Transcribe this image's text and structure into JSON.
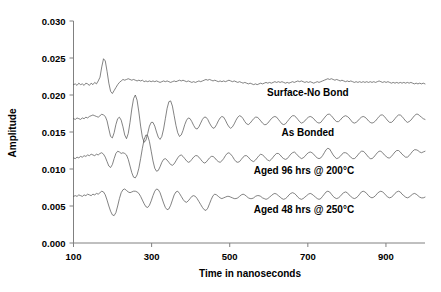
{
  "chart_data": {
    "type": "line",
    "title": "",
    "xlabel": "Time in nanoseconds",
    "ylabel": "Amplitude",
    "xlim": [
      100,
      1000
    ],
    "ylim": [
      0.0,
      0.03
    ],
    "xticks": [
      100,
      300,
      500,
      700,
      900
    ],
    "xtick_labels": [
      "100",
      "300",
      "500",
      "700",
      "900"
    ],
    "yticks": [
      0.0,
      0.005,
      0.01,
      0.015,
      0.02,
      0.025,
      0.03
    ],
    "ytick_labels": [
      "0.000",
      "0.005",
      "0.010",
      "0.015",
      "0.020",
      "0.025",
      "0.030"
    ],
    "grid": false,
    "legend_position": "inline-right-of-trace",
    "line_color": "#4d4d4d",
    "background_color": "#ffffff",
    "x_start": 100,
    "x_step": 4.5,
    "series": [
      {
        "name": "Surface-No Bond",
        "label": "Surface-No Bond",
        "baseline": 0.0215,
        "label_x": 700,
        "label_y": 0.0198,
        "values": [
          0.0214,
          0.0215,
          0.0213,
          0.0216,
          0.0214,
          0.0215,
          0.0213,
          0.0216,
          0.0215,
          0.0213,
          0.0216,
          0.0214,
          0.0217,
          0.0215,
          0.0219,
          0.0224,
          0.0238,
          0.0249,
          0.0246,
          0.0232,
          0.0216,
          0.0205,
          0.0202,
          0.0206,
          0.021,
          0.0214,
          0.0217,
          0.0219,
          0.0221,
          0.022,
          0.0221,
          0.0222,
          0.0221,
          0.022,
          0.0221,
          0.022,
          0.0219,
          0.022,
          0.0219,
          0.022,
          0.0218,
          0.0219,
          0.0218,
          0.0219,
          0.0218,
          0.0219,
          0.0218,
          0.0219,
          0.0218,
          0.0217,
          0.0218,
          0.0219,
          0.0218,
          0.0219,
          0.0218,
          0.0217,
          0.0218,
          0.0219,
          0.0218,
          0.0219,
          0.022,
          0.0219,
          0.022,
          0.0219,
          0.0218,
          0.0219,
          0.0218,
          0.0217,
          0.0218,
          0.0217,
          0.0218,
          0.0219,
          0.0218,
          0.0219,
          0.022,
          0.0221,
          0.022,
          0.0221,
          0.022,
          0.0219,
          0.022,
          0.0219,
          0.0218,
          0.0219,
          0.0218,
          0.0219,
          0.0218,
          0.0219,
          0.022,
          0.0219,
          0.0218,
          0.0219,
          0.0218,
          0.0217,
          0.0218,
          0.0217,
          0.0216,
          0.0217,
          0.0216,
          0.0215,
          0.0216,
          0.0215,
          0.0214,
          0.0215,
          0.0214,
          0.0215,
          0.0216,
          0.0215,
          0.0216,
          0.0217,
          0.0216,
          0.0217,
          0.0216,
          0.0217,
          0.0218,
          0.0217,
          0.0218,
          0.0217,
          0.0218,
          0.0217,
          0.0216,
          0.0217,
          0.0216,
          0.0217,
          0.0218,
          0.0217,
          0.0218,
          0.0219,
          0.0218,
          0.0219,
          0.0218,
          0.0217,
          0.0218,
          0.0217,
          0.0218,
          0.0217,
          0.0216,
          0.0217,
          0.0218,
          0.0217,
          0.0218,
          0.0219,
          0.022,
          0.0221,
          0.0222,
          0.0221,
          0.0222,
          0.0221,
          0.022,
          0.0221,
          0.022,
          0.0219,
          0.022,
          0.0219,
          0.0218,
          0.0219,
          0.0218,
          0.0219,
          0.0218,
          0.0217,
          0.0218,
          0.0217,
          0.0218,
          0.0217,
          0.0218,
          0.0217,
          0.0218,
          0.0217,
          0.0218,
          0.0217,
          0.0218,
          0.0217,
          0.0218,
          0.0219,
          0.0218,
          0.0217,
          0.0218,
          0.0217,
          0.0218,
          0.0217,
          0.0216,
          0.0217,
          0.0216,
          0.0217,
          0.0216,
          0.0217,
          0.0216,
          0.0217,
          0.0216,
          0.0217,
          0.0216,
          0.0217,
          0.0216,
          0.0215,
          0.0216,
          0.0215,
          0.0216,
          0.0215,
          0.0216,
          0.0215
        ]
      },
      {
        "name": "As Bonded",
        "label": "As Bonded",
        "baseline": 0.0168,
        "label_x": 700,
        "label_y": 0.0145,
        "values": [
          0.0168,
          0.0167,
          0.0169,
          0.0168,
          0.0167,
          0.0169,
          0.0168,
          0.017,
          0.0169,
          0.0171,
          0.0172,
          0.0173,
          0.0172,
          0.0171,
          0.017,
          0.0172,
          0.0174,
          0.0173,
          0.0171,
          0.0165,
          0.0154,
          0.0144,
          0.0142,
          0.0149,
          0.016,
          0.0168,
          0.017,
          0.0166,
          0.0157,
          0.0146,
          0.0141,
          0.0148,
          0.0163,
          0.0181,
          0.0195,
          0.02,
          0.0193,
          0.0177,
          0.0158,
          0.0143,
          0.0136,
          0.0139,
          0.0148,
          0.0158,
          0.0163,
          0.0163,
          0.0158,
          0.015,
          0.0143,
          0.014,
          0.0144,
          0.0154,
          0.0168,
          0.0182,
          0.0191,
          0.0192,
          0.0185,
          0.0172,
          0.0159,
          0.0149,
          0.0144,
          0.0146,
          0.0152,
          0.016,
          0.0166,
          0.0169,
          0.0168,
          0.0164,
          0.0159,
          0.0155,
          0.0154,
          0.0157,
          0.0162,
          0.0167,
          0.017,
          0.017,
          0.0167,
          0.0162,
          0.0158,
          0.0155,
          0.0156,
          0.016,
          0.0165,
          0.0169,
          0.0171,
          0.017,
          0.0166,
          0.0161,
          0.0157,
          0.0155,
          0.0157,
          0.0161,
          0.0166,
          0.017,
          0.0172,
          0.0171,
          0.0168,
          0.0164,
          0.0161,
          0.016,
          0.0162,
          0.0165,
          0.0168,
          0.017,
          0.017,
          0.0168,
          0.0165,
          0.0162,
          0.016,
          0.016,
          0.0162,
          0.0165,
          0.0168,
          0.017,
          0.0171,
          0.017,
          0.0167,
          0.0164,
          0.0161,
          0.016,
          0.0161,
          0.0164,
          0.0167,
          0.017,
          0.0172,
          0.0172,
          0.017,
          0.0167,
          0.0164,
          0.0162,
          0.0163,
          0.0165,
          0.0168,
          0.017,
          0.0171,
          0.017,
          0.0168,
          0.0165,
          0.0163,
          0.0162,
          0.0163,
          0.0166,
          0.0169,
          0.0172,
          0.0174,
          0.0174,
          0.0172,
          0.0169,
          0.0166,
          0.0164,
          0.0164,
          0.0166,
          0.0169,
          0.0171,
          0.0172,
          0.0171,
          0.0169,
          0.0166,
          0.0163,
          0.0162,
          0.0163,
          0.0165,
          0.0168,
          0.017,
          0.0171,
          0.017,
          0.0168,
          0.0165,
          0.0163,
          0.0162,
          0.0163,
          0.0165,
          0.0168,
          0.0171,
          0.0173,
          0.0173,
          0.0171,
          0.0168,
          0.0165,
          0.0163,
          0.0163,
          0.0165,
          0.0168,
          0.0171,
          0.0173,
          0.0173,
          0.0171,
          0.0168,
          0.0165,
          0.0163,
          0.0164,
          0.0166,
          0.0169,
          0.0172,
          0.0174,
          0.0174,
          0.0172,
          0.017,
          0.0168,
          0.0167
        ]
      },
      {
        "name": "Aged 96 hrs @ 200C",
        "label": "Aged 96 hrs @ 200°C",
        "baseline": 0.0115,
        "label_x": 690,
        "label_y": 0.0093,
        "values": [
          0.0115,
          0.0114,
          0.0116,
          0.0115,
          0.0117,
          0.0116,
          0.0118,
          0.0117,
          0.0119,
          0.0118,
          0.012,
          0.0119,
          0.0118,
          0.012,
          0.0119,
          0.0121,
          0.0122,
          0.012,
          0.0116,
          0.011,
          0.0104,
          0.0102,
          0.0106,
          0.0114,
          0.0121,
          0.0124,
          0.0123,
          0.0121,
          0.0122,
          0.0121,
          0.0119,
          0.0113,
          0.0104,
          0.0095,
          0.0089,
          0.0088,
          0.0092,
          0.0101,
          0.0114,
          0.0128,
          0.014,
          0.0146,
          0.0145,
          0.0137,
          0.0124,
          0.0111,
          0.0101,
          0.0097,
          0.0098,
          0.0103,
          0.0109,
          0.0113,
          0.0114,
          0.0112,
          0.0109,
          0.0106,
          0.0105,
          0.0107,
          0.0111,
          0.0115,
          0.0118,
          0.0119,
          0.0117,
          0.0114,
          0.0111,
          0.0109,
          0.011,
          0.0113,
          0.0116,
          0.0118,
          0.0118,
          0.0116,
          0.0113,
          0.011,
          0.0108,
          0.0109,
          0.0112,
          0.0115,
          0.0117,
          0.0117,
          0.0115,
          0.0112,
          0.011,
          0.0109,
          0.0111,
          0.0114,
          0.0118,
          0.0121,
          0.0122,
          0.012,
          0.0117,
          0.0113,
          0.011,
          0.0109,
          0.011,
          0.0113,
          0.0116,
          0.0118,
          0.0118,
          0.0116,
          0.0113,
          0.0111,
          0.011,
          0.0112,
          0.0115,
          0.0118,
          0.012,
          0.0119,
          0.0117,
          0.0114,
          0.0112,
          0.0111,
          0.0113,
          0.0116,
          0.0119,
          0.0121,
          0.0121,
          0.0119,
          0.0116,
          0.0114,
          0.0113,
          0.0114,
          0.0117,
          0.012,
          0.0122,
          0.0123,
          0.0121,
          0.0118,
          0.0116,
          0.0114,
          0.0115,
          0.0117,
          0.012,
          0.0122,
          0.0123,
          0.0122,
          0.012,
          0.0117,
          0.0115,
          0.0114,
          0.0115,
          0.0118,
          0.0122,
          0.0126,
          0.0128,
          0.0127,
          0.0123,
          0.0119,
          0.0116,
          0.0114,
          0.0115,
          0.0117,
          0.012,
          0.0122,
          0.0122,
          0.0121,
          0.0118,
          0.0116,
          0.0114,
          0.0114,
          0.0116,
          0.0119,
          0.0122,
          0.0124,
          0.0124,
          0.0122,
          0.0119,
          0.0116,
          0.0114,
          0.0114,
          0.0116,
          0.0119,
          0.0122,
          0.0124,
          0.0124,
          0.0122,
          0.0119,
          0.0117,
          0.0115,
          0.0115,
          0.0117,
          0.012,
          0.0123,
          0.0125,
          0.0125,
          0.0123,
          0.012,
          0.0118,
          0.0116,
          0.0116,
          0.0118,
          0.0121,
          0.0124,
          0.0126,
          0.0126,
          0.0125,
          0.0123,
          0.0122,
          0.0123,
          0.0124
        ]
      },
      {
        "name": "Aged 48 hrs @ 250C",
        "label": "Aged 48 hrs @ 250°C",
        "baseline": 0.0063,
        "label_x": 690,
        "label_y": 0.004,
        "values": [
          0.0063,
          0.0064,
          0.0063,
          0.0065,
          0.0064,
          0.0063,
          0.0065,
          0.0064,
          0.0066,
          0.0065,
          0.0064,
          0.0066,
          0.0065,
          0.0067,
          0.0066,
          0.0068,
          0.007,
          0.0069,
          0.0065,
          0.0058,
          0.005,
          0.0043,
          0.0038,
          0.0037,
          0.0041,
          0.005,
          0.006,
          0.0068,
          0.0072,
          0.0073,
          0.0071,
          0.0069,
          0.0068,
          0.0069,
          0.007,
          0.007,
          0.0069,
          0.0067,
          0.0063,
          0.0058,
          0.0053,
          0.0049,
          0.0048,
          0.0051,
          0.0057,
          0.0064,
          0.007,
          0.0073,
          0.0072,
          0.0068,
          0.0061,
          0.0054,
          0.0048,
          0.0045,
          0.0046,
          0.0051,
          0.0058,
          0.0065,
          0.0069,
          0.007,
          0.0067,
          0.0063,
          0.0059,
          0.0056,
          0.0055,
          0.0057,
          0.006,
          0.0063,
          0.0064,
          0.0063,
          0.006,
          0.0056,
          0.0052,
          0.0048,
          0.0045,
          0.0044,
          0.0047,
          0.0053,
          0.0059,
          0.0064,
          0.0066,
          0.0065,
          0.0063,
          0.0061,
          0.006,
          0.0061,
          0.0062,
          0.0063,
          0.0063,
          0.0062,
          0.0061,
          0.006,
          0.006,
          0.0061,
          0.0063,
          0.0065,
          0.0066,
          0.0065,
          0.0063,
          0.0061,
          0.006,
          0.006,
          0.0061,
          0.0063,
          0.0064,
          0.0064,
          0.0063,
          0.0061,
          0.006,
          0.0059,
          0.006,
          0.0062,
          0.0064,
          0.0066,
          0.0067,
          0.0066,
          0.0064,
          0.0062,
          0.006,
          0.0059,
          0.006,
          0.0062,
          0.0065,
          0.0067,
          0.0068,
          0.0067,
          0.0065,
          0.0062,
          0.006,
          0.0059,
          0.006,
          0.0062,
          0.0064,
          0.0066,
          0.0067,
          0.0066,
          0.0064,
          0.0062,
          0.006,
          0.0059,
          0.006,
          0.0063,
          0.0066,
          0.0069,
          0.007,
          0.0069,
          0.0066,
          0.0063,
          0.0061,
          0.006,
          0.0061,
          0.0063,
          0.0066,
          0.0068,
          0.0069,
          0.0068,
          0.0065,
          0.0063,
          0.0061,
          0.006,
          0.0061,
          0.0063,
          0.0066,
          0.0069,
          0.007,
          0.0069,
          0.0067,
          0.0064,
          0.0062,
          0.0061,
          0.0062,
          0.0064,
          0.0067,
          0.0069,
          0.007,
          0.0069,
          0.0067,
          0.0064,
          0.0062,
          0.0061,
          0.0062,
          0.0064,
          0.0067,
          0.0069,
          0.007,
          0.0069,
          0.0066,
          0.0064,
          0.0062,
          0.0061,
          0.0062,
          0.0064,
          0.0066,
          0.0067,
          0.0066,
          0.0064,
          0.0062,
          0.0061,
          0.0061,
          0.0062
        ]
      }
    ]
  }
}
